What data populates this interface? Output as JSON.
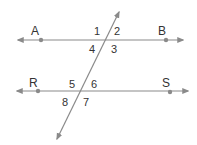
{
  "diagram": {
    "colors": {
      "line": "#8a8a8a",
      "point": "#8a8a8a",
      "text": "#333333",
      "background": "#ffffff"
    },
    "lines": [
      {
        "name": "line-AB",
        "points": [
          "A",
          "B"
        ]
      },
      {
        "name": "line-RS",
        "points": [
          "R",
          "S"
        ]
      },
      {
        "name": "transversal"
      }
    ],
    "points": {
      "A": "A",
      "B": "B",
      "R": "R",
      "S": "S"
    },
    "angles": {
      "a1": "1",
      "a2": "2",
      "a3": "3",
      "a4": "4",
      "a5": "5",
      "a6": "6",
      "a7": "7",
      "a8": "8"
    }
  }
}
